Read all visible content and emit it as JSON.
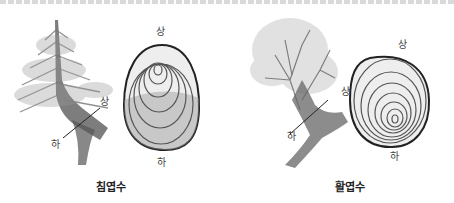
{
  "figure": {
    "top_text_cut_off": true,
    "panels": [
      {
        "id": "conifer",
        "caption": "침엽수",
        "tree_labels": {
          "upper": "상",
          "lower": "하"
        },
        "ring_labels": {
          "top": "상",
          "bottom": "하"
        },
        "ring_description": "pith offset toward top (상); wider rings on lower side (compression wood)"
      },
      {
        "id": "broadleaf",
        "caption": "활엽수",
        "tree_labels": {
          "upper": "상",
          "lower": "하"
        },
        "ring_labels": {
          "top": "상",
          "bottom": "하"
        },
        "ring_description": "pith offset toward bottom (하); wider rings on upper side (tension wood)"
      }
    ]
  }
}
